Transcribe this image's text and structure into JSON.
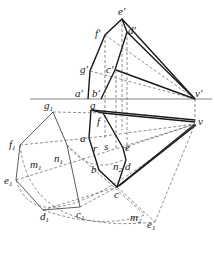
{
  "diagram": {
    "type": "descriptive-geometry-projection",
    "front_view_labels": [
      "e'",
      "f'",
      "d'",
      "g'",
      "c'",
      "a'",
      "b'",
      "v'"
    ],
    "top_view_labels": [
      "g",
      "f",
      "a",
      "r",
      "s",
      "e",
      "b",
      "n2",
      "d",
      "c",
      "v"
    ],
    "true_shape_labels": [
      "g1",
      "f1",
      "m1",
      "n1",
      "e1",
      "d1",
      "c1",
      "m2",
      "e1"
    ],
    "label_text": {
      "e_p": "e′",
      "f_p": "f′",
      "d_p": "d′",
      "g_p": "g′",
      "c_p": "c′",
      "a_p": "a′",
      "b_p": "b′",
      "v_p": "v′",
      "g": "g",
      "f": "f",
      "a": "a",
      "r": "r",
      "s": "s",
      "e": "e",
      "b": "b",
      "n2": "n",
      "n2_sub": "2",
      "d": "d",
      "c": "c",
      "v": "v",
      "g1": "g",
      "g1_sub": "1",
      "f1": "f",
      "f1_sub": "1",
      "m1": "m",
      "m1_sub": "1",
      "n1": "n",
      "n1_sub": "1",
      "e1": "e",
      "e1_sub": "1",
      "d1": "d",
      "d1_sub": "1",
      "c1": "c",
      "c1_sub": "1",
      "m2": "m",
      "m2_sub": "2",
      "e1b": "e",
      "e1b_sub": "1"
    }
  }
}
